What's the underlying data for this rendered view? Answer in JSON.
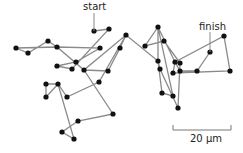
{
  "diagram": {
    "type": "random-walk-trajectory",
    "labels": {
      "start": "start",
      "finish": "finish",
      "scale_bar": "20 µm"
    },
    "colors": {
      "line": "#8a8a8a",
      "dot": "#111111",
      "text": "#222222"
    },
    "path": [
      [
        94,
        31
      ],
      [
        109,
        29
      ],
      [
        72,
        69
      ],
      [
        57,
        66
      ],
      [
        76,
        62
      ],
      [
        100,
        48
      ],
      [
        57,
        47
      ],
      [
        48,
        41
      ],
      [
        28,
        53
      ],
      [
        16,
        48
      ],
      [
        57,
        47
      ],
      [
        84,
        70
      ],
      [
        108,
        71
      ],
      [
        120,
        48
      ],
      [
        126,
        35
      ],
      [
        99,
        82
      ],
      [
        67,
        97
      ],
      [
        58,
        84
      ],
      [
        46,
        84
      ],
      [
        46,
        97
      ],
      [
        58,
        84
      ],
      [
        74,
        139
      ],
      [
        62,
        132
      ],
      [
        78,
        121
      ],
      [
        113,
        114
      ],
      [
        84,
        70
      ],
      [
        126,
        35
      ],
      [
        158,
        61
      ],
      [
        162,
        93
      ],
      [
        173,
        96
      ],
      [
        158,
        27
      ],
      [
        145,
        46
      ],
      [
        164,
        41
      ],
      [
        180,
        63
      ],
      [
        178,
        108
      ],
      [
        160,
        69
      ],
      [
        158,
        61
      ],
      [
        158,
        27
      ],
      [
        175,
        62
      ],
      [
        173,
        73
      ],
      [
        230,
        71
      ],
      [
        224,
        36
      ],
      [
        175,
        62
      ],
      [
        180,
        71
      ],
      [
        197,
        71
      ],
      [
        210,
        52
      ]
    ],
    "start_point": [
      94,
      31
    ],
    "finish_point": [
      210,
      52
    ],
    "scale_bar": {
      "x1": 173,
      "x2": 231,
      "y": 130,
      "tick": 5
    }
  }
}
